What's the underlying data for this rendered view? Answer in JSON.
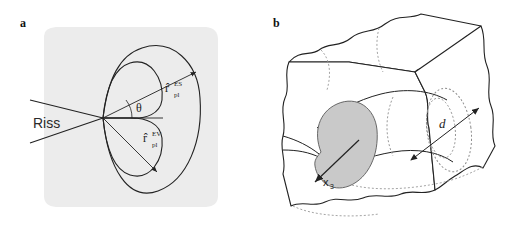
{
  "figure": {
    "width": 506,
    "height": 231,
    "background": "#ffffff",
    "type": "scientific-line-drawing",
    "panels": [
      {
        "id": "a",
        "label": "a",
        "caption_topic": "crack-tip plastic zone shapes",
        "background_shade": "#ececec",
        "elements": {
          "crack_label": "Riss",
          "angle_label": "θ",
          "outer_curve_label": {
            "base": "r̂",
            "superscript": "ES",
            "subscript": "pl",
            "meaning": "plane-stress plastic zone radius"
          },
          "inner_curve_label": {
            "base": "r̂",
            "superscript": "EV",
            "subscript": "pl",
            "meaning": "plane-strain plastic zone radius"
          }
        }
      },
      {
        "id": "b",
        "label": "b",
        "caption_topic": "3D plastic zone through thickness",
        "elements": {
          "axis_label": {
            "base": "x",
            "subscript": "3"
          },
          "dimension_label": "d",
          "shaded_region_color": "#c9c9c9",
          "hidden_line_style": "dotted"
        }
      }
    ]
  },
  "colors": {
    "ink": "#222222",
    "panel_a_shade": "#ececec",
    "kidney_fill": "#c9c9c9",
    "hidden_line": "#9a9a9a",
    "page": "#ffffff"
  }
}
